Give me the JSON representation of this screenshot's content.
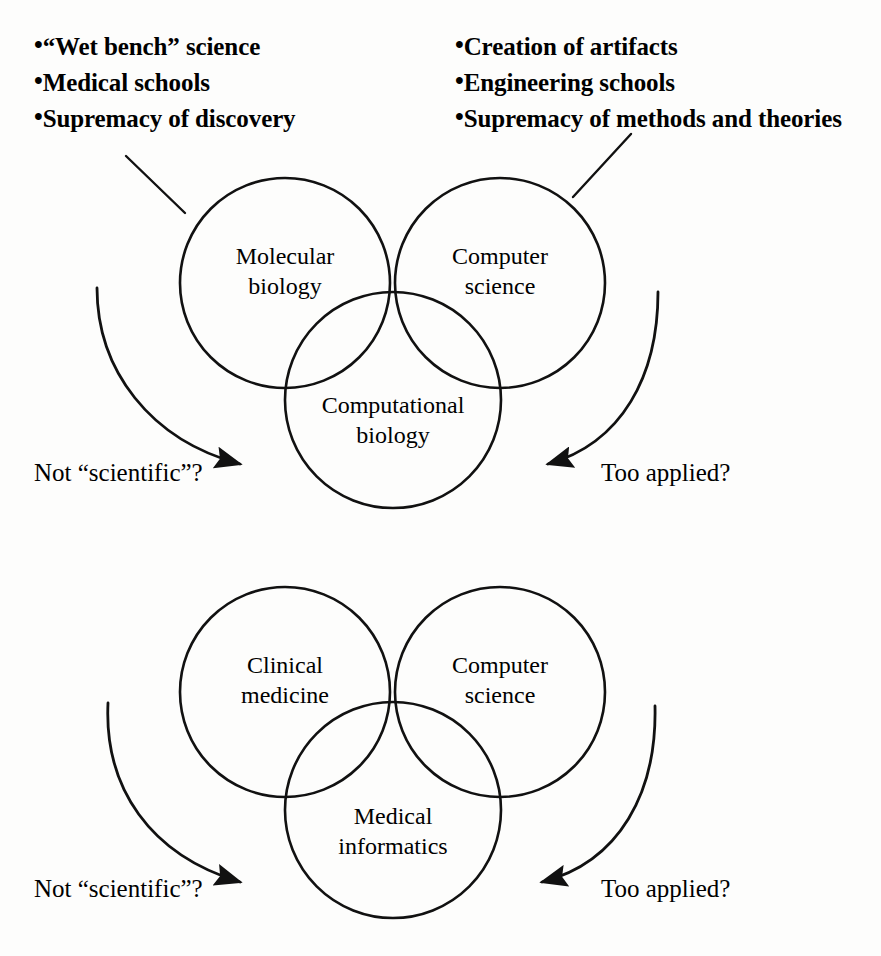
{
  "figure": {
    "title_visible": false,
    "stroke_color": "#111111",
    "background": "#fdfdfc"
  },
  "annotations": {
    "left_bullets": {
      "bullet_char": "•",
      "items": [
        "“Wet bench” science",
        "Medical schools",
        "Supremacy of discovery"
      ]
    },
    "right_bullets": {
      "bullet_char": "•",
      "items": [
        "Creation of artifacts",
        "Engineering schools",
        "Supremacy of methods and theories"
      ]
    }
  },
  "diagrams": [
    {
      "id": "computational-biology",
      "circles": [
        {
          "id": "left",
          "label_line1": "Molecular",
          "label_line2": "biology"
        },
        {
          "id": "right",
          "label_line1": "Computer",
          "label_line2": "science"
        },
        {
          "id": "bottom",
          "label_line1": "Computational",
          "label_line2": "biology"
        }
      ],
      "arrows": [
        {
          "id": "left-arrow",
          "label": "Not “scientific”?"
        },
        {
          "id": "right-arrow",
          "label": "Too applied?"
        }
      ]
    },
    {
      "id": "medical-informatics",
      "circles": [
        {
          "id": "left",
          "label_line1": "Clinical",
          "label_line2": "medicine"
        },
        {
          "id": "right",
          "label_line1": "Computer",
          "label_line2": "science"
        },
        {
          "id": "bottom",
          "label_line1": "Medical",
          "label_line2": "informatics"
        }
      ],
      "arrows": [
        {
          "id": "left-arrow",
          "label": "Not “scientific”?"
        },
        {
          "id": "right-arrow",
          "label": "Too applied?"
        }
      ]
    }
  ]
}
